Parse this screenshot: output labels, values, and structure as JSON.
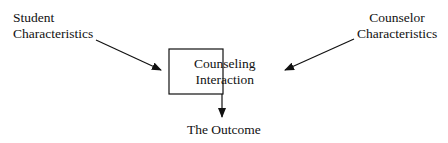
{
  "diagram": {
    "student": {
      "line1": "Student",
      "line2": "Characteristics"
    },
    "counselor": {
      "line1": "Counselor",
      "line2": "Characteristics"
    },
    "interaction": {
      "line1": "Counseling",
      "line2": "Interaction"
    },
    "outcome": "The Outcome"
  }
}
